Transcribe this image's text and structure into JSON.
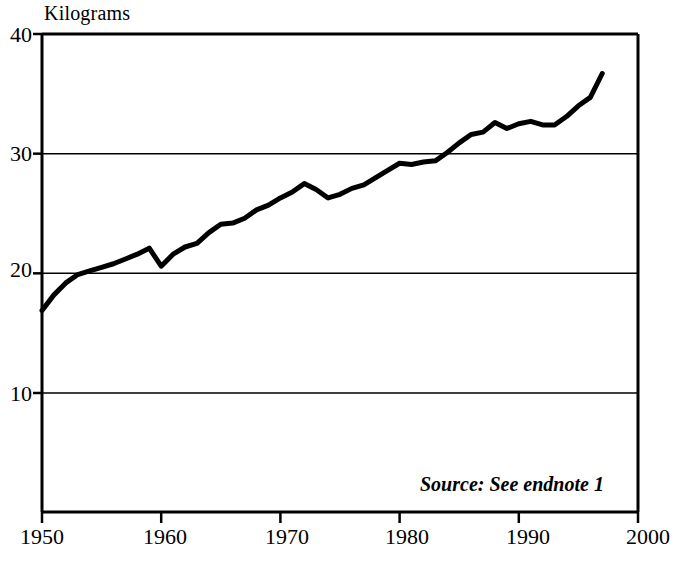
{
  "chart_data": {
    "type": "line",
    "title": "",
    "ylabel": "Kilograms",
    "xlabel": "",
    "xlim": [
      1950,
      2000
    ],
    "ylim": [
      0,
      40
    ],
    "yticks": [
      10,
      20,
      30,
      40
    ],
    "ytick_labels": [
      "10",
      "20",
      "30",
      "40"
    ],
    "xticks": [
      1950,
      1960,
      1970,
      1980,
      1990,
      2000
    ],
    "xtick_labels": [
      "1950",
      "1960",
      "1970",
      "1980",
      "1990",
      "2000"
    ],
    "grid": "horizontal",
    "legend": "none",
    "annotations": [
      "Source: See endnote 1"
    ],
    "line_color": "#000000",
    "line_width": 5,
    "series": [
      {
        "name": "Kilograms",
        "x": [
          1950,
          1951,
          1952,
          1953,
          1954,
          1955,
          1956,
          1957,
          1958,
          1959,
          1960,
          1961,
          1962,
          1963,
          1964,
          1965,
          1966,
          1967,
          1968,
          1969,
          1970,
          1971,
          1972,
          1973,
          1974,
          1975,
          1976,
          1977,
          1978,
          1979,
          1980,
          1981,
          1982,
          1983,
          1984,
          1985,
          1986,
          1987,
          1988,
          1989,
          1990,
          1991,
          1992,
          1993,
          1994,
          1995,
          1996,
          1997
        ],
        "values": [
          16.9,
          18.2,
          19.2,
          19.9,
          20.2,
          20.5,
          20.8,
          21.2,
          21.6,
          22.1,
          20.6,
          21.6,
          22.2,
          22.5,
          23.4,
          24.1,
          24.2,
          24.6,
          25.3,
          25.7,
          26.3,
          26.8,
          27.5,
          27.0,
          26.3,
          26.6,
          27.1,
          27.4,
          28.0,
          28.6,
          29.2,
          29.1,
          29.3,
          29.4,
          30.1,
          30.9,
          31.6,
          31.8,
          32.6,
          32.1,
          32.5,
          32.7,
          32.4,
          32.4,
          33.1,
          34.0,
          34.7,
          36.7
        ]
      }
    ]
  },
  "axis": {
    "y_title": "Kilograms"
  },
  "note": {
    "source_text": "Source: See endnote 1"
  }
}
